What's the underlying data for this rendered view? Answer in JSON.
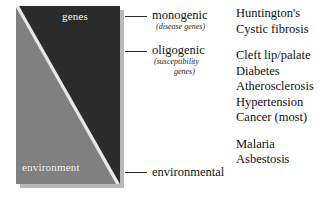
{
  "diagram": {
    "colors": {
      "genes_wedge": "#2b2b2b",
      "environment_wedge": "#808080",
      "divider": "#e8e8e8",
      "shadow": "#b9b9b9",
      "leader_line": "#2b2b2b",
      "text": "#111111",
      "wedge_text": "#ffffff"
    },
    "wedges": [
      {
        "id": "genes",
        "label": "genes",
        "color": "#2b2b2b",
        "position": "upper-right"
      },
      {
        "id": "environment",
        "label": "environment",
        "color": "#808080",
        "position": "lower-left"
      }
    ]
  },
  "categories": [
    {
      "id": "monogenic",
      "label": "monogenic",
      "sublabel_lines": [
        "(disease genes)"
      ]
    },
    {
      "id": "oligogenic",
      "label": "oligogenic",
      "sublabel_lines": [
        "(susceptibility",
        "genes)"
      ]
    },
    {
      "id": "environmental",
      "label": "environmental",
      "sublabel_lines": []
    }
  ],
  "examples": {
    "groups": [
      {
        "id": "monogenic-examples",
        "items": [
          "Huntington's",
          "Cystic fibrosis"
        ]
      },
      {
        "id": "oligogenic-examples",
        "items": [
          "Cleft lip/palate",
          "Diabetes",
          "Atherosclerosis",
          "Hypertension",
          "Cancer (most)"
        ]
      },
      {
        "id": "environmental-examples",
        "items": [
          "Malaria",
          "Asbestosis"
        ]
      }
    ]
  }
}
